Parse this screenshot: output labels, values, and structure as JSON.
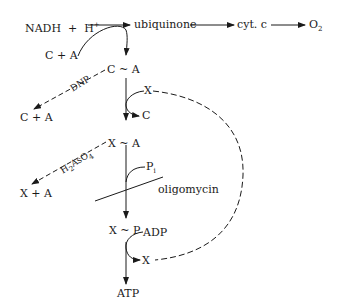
{
  "diagram": {
    "type": "reaction-pathway",
    "top_chain": {
      "nadh": "NADH",
      "plus": "+",
      "h": "H",
      "h_sup": "+",
      "ubiquinone": "ubiquinone",
      "cyt_c": "cyt. c",
      "o2": "O",
      "o2_sub": "2"
    },
    "nodes": {
      "c_plus_a_top": "C + A",
      "c_tilde_a": "C ~ A",
      "x_in_1": "X",
      "c_out": "C",
      "c_plus_a_left": "C + A",
      "x_tilde_a": "X ~ A",
      "x_plus_a": "X + A",
      "pi": "P",
      "pi_sub": "i",
      "x_tilde_p": "X ~ P",
      "adp": "ADP",
      "x_out": "X",
      "atp": "ATP"
    },
    "labels": {
      "dnp": "DNP",
      "h2aso4": "H",
      "h2aso4_sub1": "2",
      "h2aso4_mid": "AsO",
      "h2aso4_sub2": "4",
      "oligomycin": "oligomycin"
    },
    "colors": {
      "ink": "#1a1a1a",
      "background": "#ffffff"
    }
  }
}
